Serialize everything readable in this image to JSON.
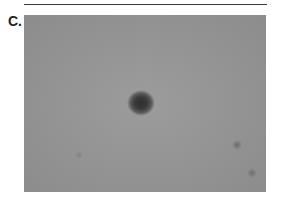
{
  "figure": {
    "panel_label": "C.",
    "image_alt": "Grayscale clinical photograph of skin showing a dark round pigmented lesion near the center, with a few faint small spots at the lower right"
  }
}
